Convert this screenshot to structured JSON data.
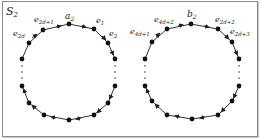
{
  "diagram": {
    "title": "S",
    "title_sub": "2",
    "left_cycle": {
      "center_label": {
        "base": "a",
        "sub": "2"
      },
      "labels": [
        {
          "id": "e2d+1",
          "base": "e",
          "sub": "2d+1"
        },
        {
          "id": "e1",
          "base": "e",
          "sub": "1"
        },
        {
          "id": "e2d",
          "base": "e",
          "sub": "2d"
        },
        {
          "id": "e2",
          "base": "e",
          "sub": "2"
        }
      ]
    },
    "right_cycle": {
      "center_label": {
        "base": "b",
        "sub": "2"
      },
      "labels": [
        {
          "id": "e4d+2",
          "base": "e",
          "sub": "4d+2"
        },
        {
          "id": "e2d+2",
          "base": "e",
          "sub": "2d+2"
        },
        {
          "id": "e4d+1",
          "base": "e",
          "sub": "4d+1"
        },
        {
          "id": "e2d+3",
          "base": "e",
          "sub": "2d+3"
        }
      ]
    },
    "colors": {
      "edge": "#333333",
      "node": "#111111",
      "frame": "#8a8a8a"
    }
  }
}
